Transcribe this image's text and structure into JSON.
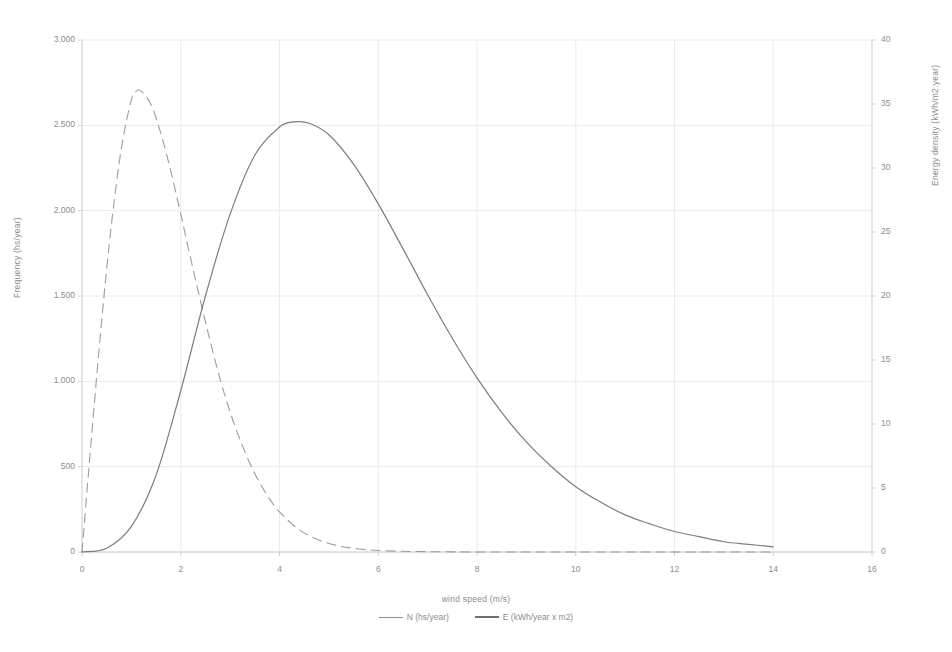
{
  "chart_data": {
    "type": "line",
    "title": "",
    "xlabel": "wind speed (m/s)",
    "ylabel": "Frequency (hs/year)",
    "y2label": "Energy density (kWh/m2.year)",
    "xlim": [
      0,
      16
    ],
    "ylim": [
      0,
      3000
    ],
    "y2lim": [
      0,
      40
    ],
    "grid": true,
    "legend_position": "bottom",
    "x_ticks": [
      "0",
      "2",
      "4",
      "6",
      "8",
      "10",
      "12",
      "14",
      "16"
    ],
    "x_tick_values": [
      0,
      2,
      4,
      6,
      8,
      10,
      12,
      14,
      16
    ],
    "y_ticks": [
      "0",
      "500",
      "1.000",
      "1.500",
      "2.000",
      "2.500",
      "3.000"
    ],
    "y_tick_values": [
      0,
      500,
      1000,
      1500,
      2000,
      2500,
      3000
    ],
    "y2_ticks": [
      "0",
      "5",
      "10",
      "15",
      "20",
      "25",
      "30",
      "35",
      "40"
    ],
    "y2_tick_values": [
      0,
      5,
      10,
      15,
      20,
      25,
      30,
      35,
      40
    ],
    "series": [
      {
        "name": "N (hs/year)",
        "axis": "left",
        "style": "dashed-thin",
        "color": "#8c8c8c",
        "x": [
          0.0,
          0.2,
          0.4,
          0.6,
          0.8,
          1.0,
          1.1,
          1.2,
          1.4,
          1.6,
          1.8,
          2.0,
          2.2,
          2.4,
          2.6,
          2.8,
          3.0,
          3.2,
          3.4,
          3.6,
          3.8,
          4.0,
          4.4,
          4.8,
          5.2,
          5.6,
          6.0,
          6.5,
          7.0,
          7.5,
          8.0,
          8.5,
          9.0,
          9.5,
          10.0,
          11.0,
          12.0,
          13.0,
          14.0
        ],
        "y": [
          0,
          700,
          1360,
          1930,
          2370,
          2650,
          2700,
          2700,
          2620,
          2450,
          2230,
          1980,
          1720,
          1470,
          1230,
          1010,
          820,
          660,
          520,
          405,
          310,
          235,
          130,
          70,
          36,
          18,
          9,
          4,
          2,
          1,
          0,
          0,
          0,
          0,
          0,
          0,
          0,
          0,
          0
        ]
      },
      {
        "name": "E (kWh/year x m2)",
        "axis": "right",
        "style": "solid",
        "color": "#6f6f6f",
        "x": [
          0.0,
          0.5,
          1.0,
          1.5,
          2.0,
          2.5,
          3.0,
          3.5,
          4.0,
          4.3,
          4.6,
          5.0,
          5.5,
          6.0,
          6.5,
          7.0,
          7.5,
          8.0,
          8.5,
          9.0,
          9.5,
          10.0,
          10.5,
          11.0,
          11.5,
          12.0,
          12.5,
          13.0,
          13.5,
          14.0
        ],
        "y": [
          0.0,
          0.3,
          2.0,
          6.0,
          12.6,
          20.0,
          26.4,
          31.0,
          33.2,
          33.6,
          33.5,
          32.6,
          30.3,
          27.2,
          23.7,
          20.1,
          16.7,
          13.6,
          10.9,
          8.6,
          6.7,
          5.1,
          3.9,
          2.9,
          2.2,
          1.6,
          1.2,
          0.8,
          0.6,
          0.4
        ]
      }
    ],
    "annotations": {
      "n_peak": {
        "x": 1.1,
        "y": 2700
      },
      "e_peak": {
        "x": 4.6,
        "y": 33.6
      },
      "crossover": {
        "x": 2.8
      }
    }
  },
  "axis": {
    "x_title": "wind speed (m/s)",
    "y_left_title": "Frequency (hs/year)",
    "y_right_title": "Energy density (kWh/m2.year)"
  },
  "legend": {
    "items": [
      {
        "label": "N (hs/year)"
      },
      {
        "label": "E (kWh/year x m2)"
      }
    ]
  },
  "colors": {
    "series_n": "#8c8c8c",
    "series_e": "#6f6f6f",
    "grid": "#e3e3e3",
    "axis": "#cfcfcf",
    "text": "#8d8d8d"
  }
}
